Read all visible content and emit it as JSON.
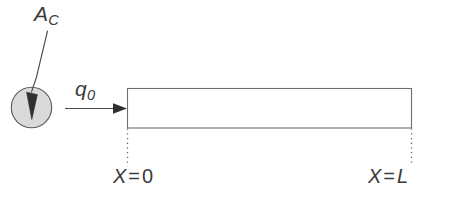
{
  "figure": {
    "background_color": "#ffffff",
    "line_color": "#4a4a4a",
    "fill_color": "#d9d9d9",
    "text_color": "#3a3a3a"
  },
  "labels": {
    "area": {
      "symbol": "A",
      "subscript": "C",
      "full": "A_C",
      "meaning": "cross-sectional-area"
    },
    "flux": {
      "symbol": "q",
      "subscript": "0",
      "full": "q_0",
      "meaning": "applied-heat-flux"
    },
    "left_boundary": {
      "symbol": "X",
      "operator": "=",
      "value": "0",
      "full": "X = 0"
    },
    "right_boundary": {
      "symbol": "X",
      "operator": "=",
      "value": "L",
      "full": "X = L"
    }
  },
  "shapes": {
    "cross_section_circle": {
      "name": "cross-section-circle",
      "center_x": 31.5,
      "center_y": 107.5,
      "radius": 20.5,
      "fill": "#d9d9d9",
      "stroke": "#555555"
    },
    "bar": {
      "name": "bar-rectangle",
      "x": 127,
      "y": 88,
      "width": 285,
      "height": 40,
      "fill": "#ffffff",
      "stroke": "#6a6a6a"
    },
    "flux_arrow": {
      "name": "flux-arrow",
      "x1": 65,
      "y1": 108,
      "x2": 127,
      "y2": 108
    },
    "leader_line": {
      "name": "area-leader-line",
      "from_x": 46,
      "from_y": 30,
      "to_x": 31,
      "to_y": 104
    },
    "left_dotted_line": {
      "name": "left-boundary-dotted-line",
      "x": 127,
      "y1": 128,
      "y2": 163
    },
    "right_dotted_line": {
      "name": "right-boundary-dotted-line",
      "x": 412,
      "y1": 128,
      "y2": 163
    }
  }
}
